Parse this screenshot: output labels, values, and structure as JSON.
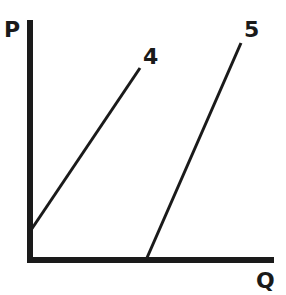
{
  "diagram": {
    "y_axis_label": "P",
    "x_axis_label": "Q",
    "curves": [
      {
        "label": "4",
        "x1": 31,
        "y1": 230,
        "x2": 140,
        "y2": 68
      },
      {
        "label": "5",
        "x1": 146,
        "y1": 260,
        "x2": 241,
        "y2": 43
      }
    ],
    "colors": {
      "ink": "#1a1a1a",
      "background": "#ffffff"
    }
  }
}
